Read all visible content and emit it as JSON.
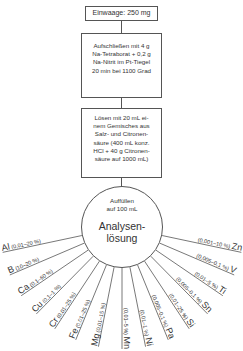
{
  "steps": [
    {
      "text": "Einwaage: 250 mg"
    },
    {
      "lines": [
        "Aufschließen mit 4 g",
        "Na-Tetraborat + 0,2 g",
        "Na-Nitrit im Pt-Tiegel",
        "20 min bei 1100 Grad"
      ]
    },
    {
      "lines": [
        "Lösen mit 20 mL ei-",
        "nem Gemisches aus",
        "Salz- und Citronen-",
        "säure (400 mL konz.",
        "HCl + 40 g Citronen-",
        "säure auf 1000 mL)"
      ]
    }
  ],
  "circle": {
    "top_lines": [
      "Auffüllen",
      "auf 100 mL"
    ],
    "title_lines": [
      "Analysen-",
      "lösung"
    ]
  },
  "elements": [
    {
      "symbol": "Al",
      "range": "(0,01–20 %)"
    },
    {
      "symbol": "B",
      "range": "(10–20 %)"
    },
    {
      "symbol": "Ca",
      "range": "(0,1–60 %)"
    },
    {
      "symbol": "Cu",
      "range": "(0,1–1 %)"
    },
    {
      "symbol": "Cr",
      "range": "(0,01–25 %)"
    },
    {
      "symbol": "Fe",
      "range": "(0,01–25 %)"
    },
    {
      "symbol": "Mg",
      "range": "(0,01–15 %)"
    },
    {
      "symbol": "Mn",
      "range": "(0,01–5 %)"
    },
    {
      "symbol": "Ni",
      "range": "(0,01–1 %)"
    },
    {
      "symbol": "Pa",
      "range": "(0,005–0,1 %)"
    },
    {
      "symbol": "Si",
      "range": "(0,01–25 %)"
    },
    {
      "symbol": "Sn",
      "range": "(0,005–0,1 %)"
    },
    {
      "symbol": "Ti",
      "range": "(0,01–5 %)"
    },
    {
      "symbol": "V",
      "range": "(0,005–0,1 %)"
    },
    {
      "symbol": "Zn",
      "range": "(0,001–10 %)"
    }
  ]
}
